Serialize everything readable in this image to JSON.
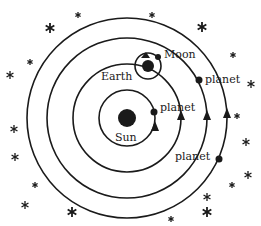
{
  "colors": {
    "ink": "#1a1a1a",
    "background": "#ffffff"
  },
  "labels": {
    "sun": "Sun",
    "earth": "Earth",
    "moon": "Moon",
    "planet_inner": "planet",
    "planet_middle": "planet",
    "planet_outer": "planet"
  },
  "orbits": [
    {
      "name": "inner-planet-orbit",
      "radius": 28
    },
    {
      "name": "earth-orbit",
      "radius": 54
    },
    {
      "name": "middle-planet-orbit",
      "radius": 80
    },
    {
      "name": "outer-planet-orbit",
      "radius": 100
    }
  ],
  "stars": [
    [
      78,
      15,
      3
    ],
    [
      50,
      28,
      5
    ],
    [
      30,
      62,
      3
    ],
    [
      10,
      75,
      4
    ],
    [
      14,
      129,
      4
    ],
    [
      15,
      157,
      4
    ],
    [
      35,
      185,
      3
    ],
    [
      25,
      205,
      4
    ],
    [
      72,
      212,
      5
    ],
    [
      171,
      219,
      3
    ],
    [
      207,
      197,
      4
    ],
    [
      207,
      212,
      5
    ],
    [
      232,
      185,
      3
    ],
    [
      248,
      175,
      4
    ],
    [
      246,
      142,
      4
    ],
    [
      237,
      116,
      3
    ],
    [
      251,
      84,
      4
    ],
    [
      233,
      55,
      3
    ],
    [
      202,
      27,
      5
    ],
    [
      152,
      15,
      3
    ]
  ]
}
